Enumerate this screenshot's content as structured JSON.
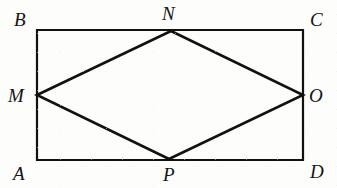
{
  "figure": {
    "type": "geometry-diagram",
    "stroke_color": "#111111",
    "background_color": "#fdfdfc",
    "rectangle_stroke_width": 2.2,
    "rhombus_stroke_width": 2.6,
    "canvas": {
      "width": 337,
      "height": 188
    },
    "rectangle": {
      "name": "ABCD",
      "vertices": [
        {
          "id": "A",
          "label": "A",
          "x": 37,
          "y": 160
        },
        {
          "id": "B",
          "label": "B",
          "x": 37,
          "y": 30
        },
        {
          "id": "C",
          "label": "C",
          "x": 303,
          "y": 30
        },
        {
          "id": "D",
          "label": "D",
          "x": 303,
          "y": 160
        }
      ],
      "path": "M 37 30 L 303 30 L 303 160 L 37 160 Z"
    },
    "rhombus": {
      "name": "MNOP",
      "vertices": [
        {
          "id": "M",
          "label": "M",
          "x": 37,
          "y": 95
        },
        {
          "id": "N",
          "label": "N",
          "x": 171,
          "y": 31
        },
        {
          "id": "O",
          "label": "O",
          "x": 303,
          "y": 95
        },
        {
          "id": "P",
          "label": "P",
          "x": 169,
          "y": 159
        }
      ],
      "path": "M 37 95 L 171 31 L 303 95 L 169 159 Z"
    },
    "labels": [
      {
        "id": "B",
        "text": "B",
        "left": 14,
        "top": 10
      },
      {
        "id": "N",
        "text": "N",
        "left": 162,
        "top": 4
      },
      {
        "id": "C",
        "text": "C",
        "left": 310,
        "top": 10
      },
      {
        "id": "M",
        "text": "M",
        "left": 8,
        "top": 86
      },
      {
        "id": "O",
        "text": "O",
        "left": 309,
        "top": 86
      },
      {
        "id": "A",
        "text": "A",
        "left": 13,
        "top": 164
      },
      {
        "id": "P",
        "text": "P",
        "left": 163,
        "top": 165
      },
      {
        "id": "D",
        "text": "D",
        "left": 310,
        "top": 162
      }
    ]
  }
}
